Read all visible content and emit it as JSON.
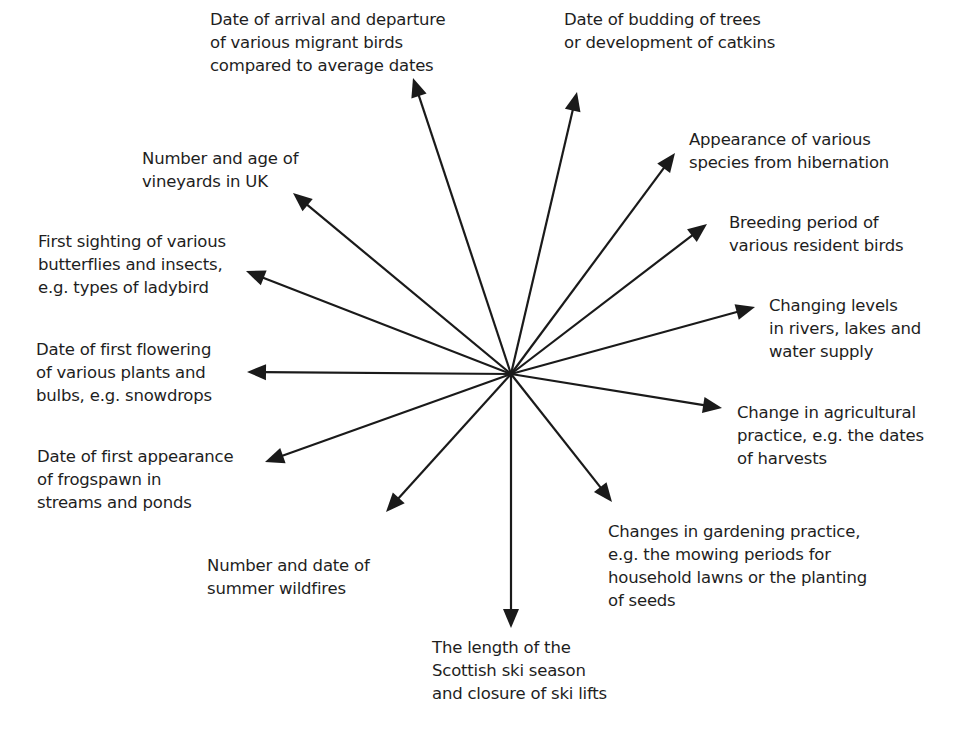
{
  "diagram": {
    "type": "spider-diagram",
    "center": {
      "x": 511,
      "y": 374
    },
    "line_color": "#1a1a1a",
    "nodes": [
      {
        "id": "migrant-birds",
        "text": "Date of arrival and departure\nof various migrant birds\ncompared to average dates",
        "tip": {
          "x": 413,
          "y": 78
        },
        "label_pos": {
          "x": 210,
          "y": 8
        }
      },
      {
        "id": "budding-trees",
        "text": "Date of budding of trees\nor development of catkins",
        "tip": {
          "x": 577,
          "y": 92
        },
        "label_pos": {
          "x": 564,
          "y": 8
        }
      },
      {
        "id": "hibernation",
        "text": "Appearance of various\nspecies from hibernation",
        "tip": {
          "x": 675,
          "y": 153
        },
        "label_pos": {
          "x": 689,
          "y": 128
        }
      },
      {
        "id": "resident-birds",
        "text": "Breeding period of\nvarious resident birds",
        "tip": {
          "x": 707,
          "y": 224
        },
        "label_pos": {
          "x": 729,
          "y": 211
        }
      },
      {
        "id": "water-levels",
        "text": "Changing levels\nin rivers, lakes and\nwater supply",
        "tip": {
          "x": 755,
          "y": 307
        },
        "label_pos": {
          "x": 769,
          "y": 294
        }
      },
      {
        "id": "agriculture",
        "text": "Change in agricultural\npractice, e.g. the dates\nof harvests",
        "tip": {
          "x": 722,
          "y": 408
        },
        "label_pos": {
          "x": 737,
          "y": 401
        }
      },
      {
        "id": "gardening",
        "text": "Changes in gardening practice,\ne.g. the mowing periods for\nhousehold lawns or the planting\nof seeds",
        "tip": {
          "x": 612,
          "y": 502
        },
        "label_pos": {
          "x": 608,
          "y": 520
        }
      },
      {
        "id": "ski-season",
        "text": "The length of the\nScottish ski season\nand closure of ski lifts",
        "tip": {
          "x": 511,
          "y": 628
        },
        "label_pos": {
          "x": 432,
          "y": 636
        }
      },
      {
        "id": "wildfires",
        "text": "Number and date of\nsummer wildfires",
        "tip": {
          "x": 386,
          "y": 512
        },
        "label_pos": {
          "x": 207,
          "y": 554
        }
      },
      {
        "id": "frogspawn",
        "text": "Date of first appearance\nof frogspawn in\nstreams and ponds",
        "tip": {
          "x": 265,
          "y": 462
        },
        "label_pos": {
          "x": 37,
          "y": 445
        }
      },
      {
        "id": "flowering",
        "text": "Date of first flowering\nof various plants and\nbulbs, e.g. snowdrops",
        "tip": {
          "x": 247,
          "y": 372
        },
        "label_pos": {
          "x": 36,
          "y": 338
        }
      },
      {
        "id": "butterflies",
        "text": "First sighting of various\nbutterflies and insects,\ne.g. types of ladybird",
        "tip": {
          "x": 246,
          "y": 271
        },
        "label_pos": {
          "x": 38,
          "y": 230
        }
      },
      {
        "id": "vineyards",
        "text": "Number and age of\nvineyards in UK",
        "tip": {
          "x": 293,
          "y": 193
        },
        "label_pos": {
          "x": 142,
          "y": 147
        }
      }
    ]
  }
}
